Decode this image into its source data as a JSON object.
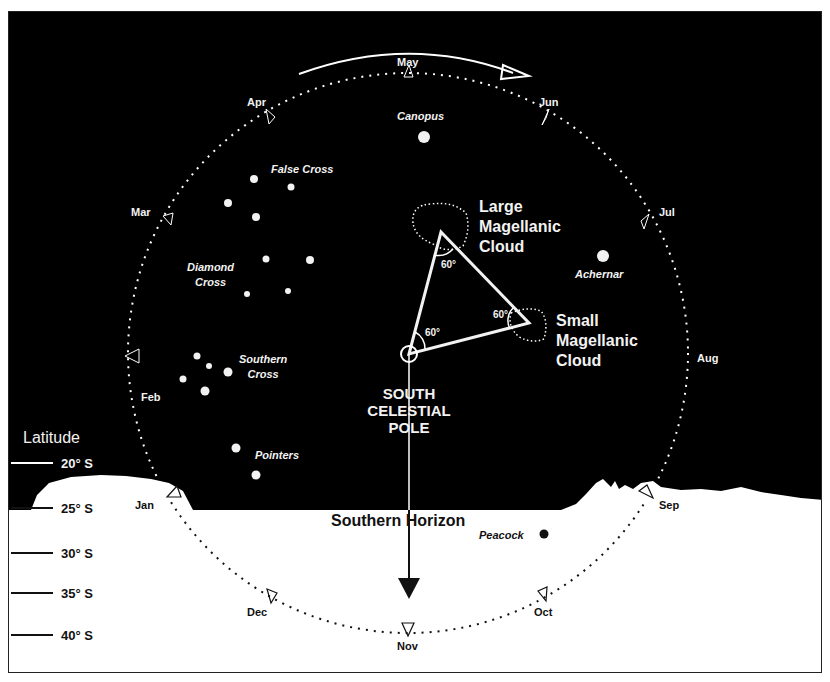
{
  "diagram": {
    "title_regions": {
      "scp": [
        "SOUTH",
        "CELESTIAL",
        "POLE"
      ],
      "horizon": "Southern Horizon"
    },
    "latitude": {
      "heading": "Latitude",
      "marks": [
        "20° S",
        "25° S",
        "30° S",
        "35° S",
        "40° S"
      ]
    },
    "months": {
      "jan": "Jan",
      "feb": "Feb",
      "mar": "Mar",
      "apr": "Apr",
      "may": "May",
      "jun": "Jun",
      "jul": "Jul",
      "aug": "Aug",
      "sep": "Sep",
      "oct": "Oct",
      "nov": "Nov",
      "dec": "Dec"
    },
    "stars": {
      "canopus": "Canopus",
      "false_cross": "False Cross",
      "diamond_cross": [
        "Diamond",
        "Cross"
      ],
      "southern_cross": [
        "Southern",
        "Cross"
      ],
      "pointers": "Pointers",
      "achernar": "Achernar",
      "peacock": "Peacock"
    },
    "clouds": {
      "lmc": [
        "Large",
        "Magellanic",
        "Cloud"
      ],
      "smc": [
        "Small",
        "Magellanic",
        "Cloud"
      ]
    },
    "angles": [
      "60°",
      "60°",
      "60°"
    ],
    "colors": {
      "sky": "#000000",
      "ground": "#ffffff",
      "stars": "#f2f2f2"
    }
  }
}
